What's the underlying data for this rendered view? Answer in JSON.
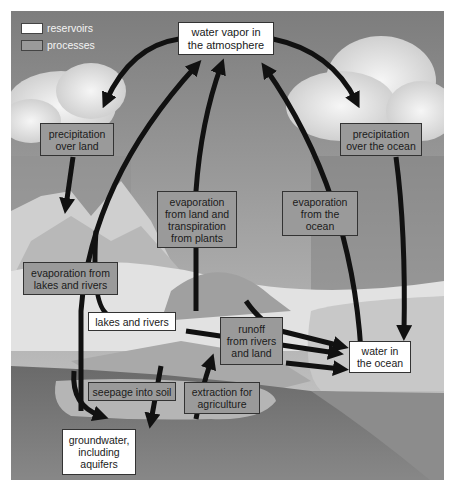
{
  "legend": {
    "items": [
      {
        "label": "reservoirs",
        "color": "#ffffff"
      },
      {
        "label": "processes",
        "color": "#9a9a9a"
      }
    ]
  },
  "reservoirs": {
    "atmosphere": {
      "line1": "water vapor in",
      "line2": "the atmosphere"
    },
    "lakes": {
      "line1": "lakes and rivers"
    },
    "ocean": {
      "line1": "water in",
      "line2": "the ocean"
    },
    "groundwater": {
      "line1": "groundwater,",
      "line2": "including",
      "line3": "aquifers"
    }
  },
  "processes": {
    "precip_land": {
      "line1": "precipitation",
      "line2": "over land"
    },
    "precip_ocean": {
      "line1": "precipitation",
      "line2": "over the ocean"
    },
    "evap_land": {
      "line1": "evaporation",
      "line2": "from land and",
      "line3": "transpiration",
      "line4": "from plants"
    },
    "evap_ocean": {
      "line1": "evaporation",
      "line2": "from the",
      "line3": "ocean"
    },
    "evap_lakes": {
      "line1": "evaporation from",
      "line2": "lakes and rivers"
    },
    "runoff": {
      "line1": "runoff",
      "line2": "from rivers",
      "line3": "and land"
    },
    "seepage": {
      "line1": "seepage into soil"
    },
    "extraction": {
      "line1": "extraction for",
      "line2": "agriculture"
    }
  },
  "colors": {
    "reservoir_fill": "#ffffff",
    "process_fill": "#9a9a9a",
    "arrow": "#111111",
    "sky": "#8a8a8a",
    "ground": "#5a5a5a"
  }
}
